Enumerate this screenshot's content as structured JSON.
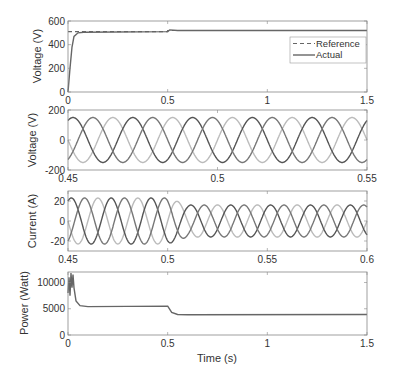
{
  "chart_data": [
    {
      "type": "line",
      "title": "",
      "xlabel": "",
      "ylabel": "Voltage (V)",
      "xlim": [
        0,
        1.5
      ],
      "ylim": [
        0,
        600
      ],
      "xticks": [
        "0",
        "0.5",
        "1",
        "1.5"
      ],
      "yticks": [
        "0",
        "200",
        "400",
        "600"
      ],
      "grid": false,
      "legend": {
        "position": "inside-right",
        "entries": [
          "Reference",
          "Actual"
        ]
      },
      "series": [
        {
          "name": "Reference",
          "style": "dashed",
          "x": [
            0,
            0.5,
            0.5,
            1.5
          ],
          "values": [
            510,
            510,
            520,
            520
          ]
        },
        {
          "name": "Actual",
          "style": "solid",
          "x": [
            0,
            0.01,
            0.02,
            0.03,
            0.05,
            0.08,
            0.5,
            0.51,
            0.55,
            1.5
          ],
          "values": [
            0,
            200,
            380,
            470,
            500,
            505,
            510,
            525,
            520,
            520
          ]
        }
      ]
    },
    {
      "type": "line",
      "title": "",
      "xlabel": "",
      "ylabel": "Voltage (V)",
      "xlim": [
        0.45,
        0.55
      ],
      "ylim": [
        -200,
        200
      ],
      "xticks": [
        "0.45",
        "0.5",
        "0.55"
      ],
      "yticks": [
        "-200",
        "0",
        "200"
      ],
      "grid": false,
      "description": "Three-phase sinusoidal voltages, 50 Hz, amplitude ~150 V, 120° apart",
      "series": [
        {
          "name": "Phase A",
          "amplitude": 150,
          "frequency_hz": 50,
          "phase_deg": 0
        },
        {
          "name": "Phase B",
          "amplitude": 150,
          "frequency_hz": 50,
          "phase_deg": -120
        },
        {
          "name": "Phase C",
          "amplitude": 150,
          "frequency_hz": 50,
          "phase_deg": 120
        }
      ]
    },
    {
      "type": "line",
      "title": "",
      "xlabel": "",
      "ylabel": "Current (A)",
      "xlim": [
        0.45,
        0.6
      ],
      "ylim": [
        -30,
        30
      ],
      "xticks": [
        "0.45",
        "0.5",
        "0.55",
        "0.6"
      ],
      "yticks": [
        "-20",
        "0",
        "20"
      ],
      "grid": false,
      "description": "Three-phase sinusoidal currents, 50 Hz; amplitude ~23 A before t=0.5 s, dropping to ~16 A after",
      "series": [
        {
          "name": "Phase A",
          "amplitude_before": 23,
          "amplitude_after": 16,
          "step_time": 0.5,
          "frequency_hz": 50,
          "phase_deg": 0
        },
        {
          "name": "Phase B",
          "amplitude_before": 23,
          "amplitude_after": 16,
          "step_time": 0.5,
          "frequency_hz": 50,
          "phase_deg": -120
        },
        {
          "name": "Phase C",
          "amplitude_before": 23,
          "amplitude_after": 16,
          "step_time": 0.5,
          "frequency_hz": 50,
          "phase_deg": 120
        }
      ]
    },
    {
      "type": "line",
      "title": "",
      "xlabel": "Time (s)",
      "ylabel": "Power (Watt)",
      "xlim": [
        0,
        1.5
      ],
      "ylim": [
        0,
        12000
      ],
      "xticks": [
        "0",
        "0.5",
        "1",
        "1.5"
      ],
      "yticks": [
        "0",
        "5000",
        "10000"
      ],
      "grid": false,
      "series": [
        {
          "name": "Power",
          "x": [
            0,
            0.005,
            0.01,
            0.015,
            0.02,
            0.025,
            0.03,
            0.04,
            0.06,
            0.1,
            0.5,
            0.52,
            0.55,
            0.6,
            1.5
          ],
          "values": [
            8000,
            11000,
            7500,
            12000,
            9000,
            11500,
            9000,
            6500,
            5600,
            5400,
            5500,
            4300,
            3900,
            3850,
            3900
          ]
        }
      ]
    }
  ],
  "panels": {
    "p1": {
      "ylabel": "Voltage (V)",
      "xticks": [
        "0",
        "0.5",
        "1",
        "1.5"
      ],
      "yticks": [
        "0",
        "200",
        "400",
        "600"
      ],
      "legend": [
        "Reference",
        "Actual"
      ]
    },
    "p2": {
      "ylabel": "Voltage (V)",
      "xticks": [
        "0.45",
        "0.5",
        "0.55"
      ],
      "yticks": [
        "-200",
        "0",
        "200"
      ]
    },
    "p3": {
      "ylabel": "Current (A)",
      "xticks": [
        "0.45",
        "0.5",
        "0.55",
        "0.6"
      ],
      "yticks": [
        "-20",
        "0",
        "20"
      ]
    },
    "p4": {
      "ylabel": "Power (Watt)",
      "xticks": [
        "0",
        "0.5",
        "1",
        "1.5"
      ],
      "yticks": [
        "0",
        "5000",
        "10000"
      ],
      "xlabel": "Time (s)"
    }
  },
  "colors": {
    "axis": "#888888",
    "line_dark": "#555555",
    "line_mid": "#777777",
    "line_light": "#bbbbbb",
    "text": "#333333"
  }
}
